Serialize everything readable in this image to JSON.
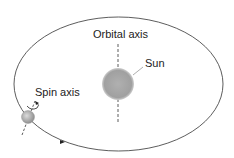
{
  "diagram": {
    "labels": {
      "orbital_axis": "Orbital axis",
      "sun": "Sun",
      "spin_axis": "Spin axis"
    },
    "colors": {
      "orbit_line": "#333333",
      "sun_fill": "#a8a8a8",
      "earth_fill": "#b5b5b5",
      "text": "#222222"
    },
    "icons": {
      "orbit_direction": "arrowhead",
      "spin_rotation": "curved-arrow"
    }
  }
}
